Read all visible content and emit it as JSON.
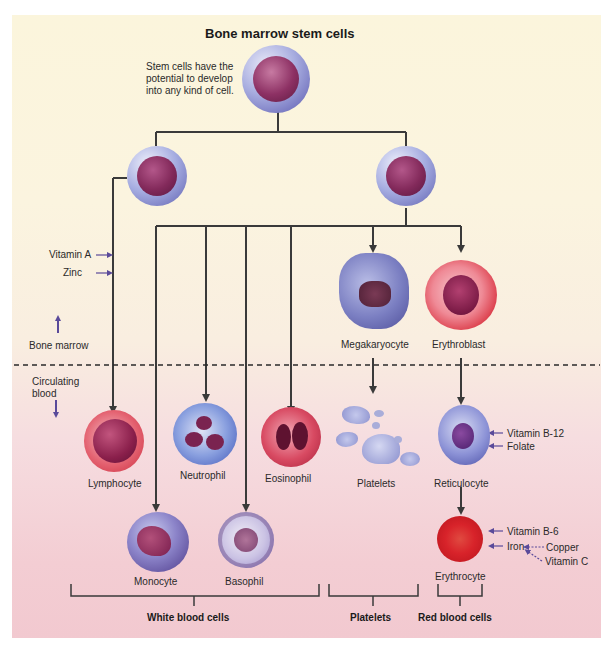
{
  "title": "Bone marrow stem cells",
  "stem_note": "Stem cells have the potential to develop into any kind of cell.",
  "stem_note_lines": [
    "Stem cells have the",
    "potential to develop",
    "into any kind of cell."
  ],
  "zones": {
    "bone_marrow": "Bone marrow",
    "circulating_blood_line1": "Circulating",
    "circulating_blood_line2": "blood"
  },
  "lymphoid_nutrients": [
    "Vitamin A",
    "Zinc"
  ],
  "cells": {
    "megakaryocyte": "Megakaryocyte",
    "erythroblast": "Erythroblast",
    "lymphocyte": "Lymphocyte",
    "neutrophil": "Neutrophil",
    "eosinophil": "Eosinophil",
    "platelets": "Platelets",
    "reticulocyte": "Reticulocyte",
    "monocyte": "Monocyte",
    "basophil": "Basophil",
    "erythrocyte": "Erythrocyte"
  },
  "reticulocyte_nutrients": [
    "Vitamin B-12",
    "Folate"
  ],
  "erythrocyte_nutrients": [
    "Vitamin B-6",
    "Iron"
  ],
  "iron_cofactors": [
    "Copper",
    "Vitamin C"
  ],
  "groups": {
    "white": "White blood cells",
    "platelets": "Platelets",
    "red": "Red blood cells"
  },
  "colors": {
    "line": "#3a3a3a",
    "nutrient_arrow": "#5a4a9a",
    "stem_membrane": "#7f7fc4",
    "stem_nucleus": "#8a2f5e",
    "red_cell": "#d8232a",
    "background_top": "#fbf5dc",
    "background_bottom": "#f2c9d0"
  }
}
